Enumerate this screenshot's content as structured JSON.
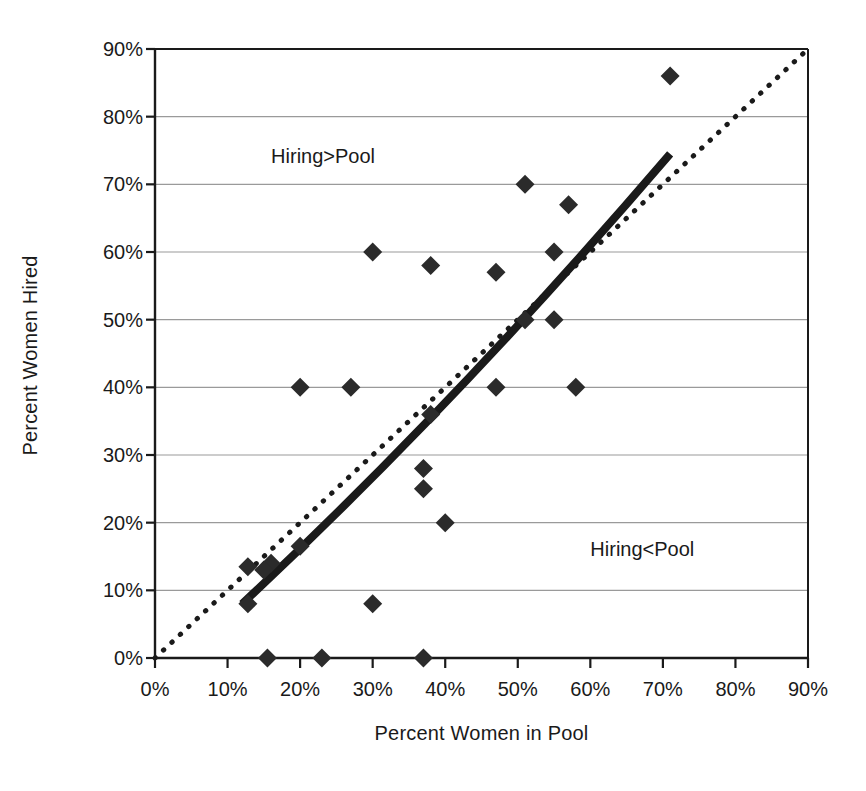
{
  "chart_data": {
    "type": "scatter",
    "title": "",
    "xlabel": "Percent Women in Pool",
    "ylabel": "Percent Women Hired",
    "xlim": [
      0,
      90
    ],
    "ylim": [
      0,
      90
    ],
    "xticks": [
      "0%",
      "10%",
      "20%",
      "30%",
      "40%",
      "50%",
      "60%",
      "70%",
      "80%",
      "90%"
    ],
    "yticks": [
      "0%",
      "10%",
      "20%",
      "30%",
      "40%",
      "50%",
      "60%",
      "70%",
      "80%",
      "90%"
    ],
    "xtick_values": [
      0,
      10,
      20,
      30,
      40,
      50,
      60,
      70,
      80,
      90
    ],
    "ytick_values": [
      0,
      10,
      20,
      30,
      40,
      50,
      60,
      70,
      80,
      90
    ],
    "grid": "horizontal",
    "grid_color": "#9a9a9a",
    "legend": "none",
    "marker": "diamond",
    "marker_color": "#2b2b2b",
    "marker_size": 19,
    "points": [
      {
        "x": 71,
        "y": 86
      },
      {
        "x": 51,
        "y": 70
      },
      {
        "x": 57,
        "y": 67
      },
      {
        "x": 30,
        "y": 60
      },
      {
        "x": 55,
        "y": 60
      },
      {
        "x": 38,
        "y": 58
      },
      {
        "x": 47,
        "y": 57
      },
      {
        "x": 51,
        "y": 50
      },
      {
        "x": 55,
        "y": 50
      },
      {
        "x": 20,
        "y": 40
      },
      {
        "x": 27,
        "y": 40
      },
      {
        "x": 47,
        "y": 40
      },
      {
        "x": 58,
        "y": 40
      },
      {
        "x": 38,
        "y": 36
      },
      {
        "x": 37,
        "y": 28
      },
      {
        "x": 37,
        "y": 25
      },
      {
        "x": 40,
        "y": 20
      },
      {
        "x": 20,
        "y": 16.5
      },
      {
        "x": 16,
        "y": 14
      },
      {
        "x": 12.8,
        "y": 13.5
      },
      {
        "x": 15,
        "y": 13
      },
      {
        "x": 12.8,
        "y": 8
      },
      {
        "x": 30,
        "y": 8
      },
      {
        "x": 15.5,
        "y": 0
      },
      {
        "x": 23,
        "y": 0
      },
      {
        "x": 37,
        "y": 0
      }
    ],
    "reference_line": {
      "name": "parity-line",
      "style": "dotted",
      "color": "#1a1a1a",
      "width": 5,
      "from": {
        "x": 0,
        "y": 0
      },
      "to": {
        "x": 90,
        "y": 90
      }
    },
    "trend_line": {
      "name": "trend-line",
      "style": "solid",
      "color": "#1a1a1a",
      "width": 8,
      "from": {
        "x": 12,
        "y": 8
      },
      "to": {
        "x": 71,
        "y": 74.5
      },
      "bend": {
        "x": 41,
        "y": 37
      }
    },
    "annotations": [
      {
        "text": "Hiring>Pool",
        "x": 16,
        "y": 74
      },
      {
        "text": "Hiring<Pool",
        "x": 60,
        "y": 16
      }
    ]
  }
}
